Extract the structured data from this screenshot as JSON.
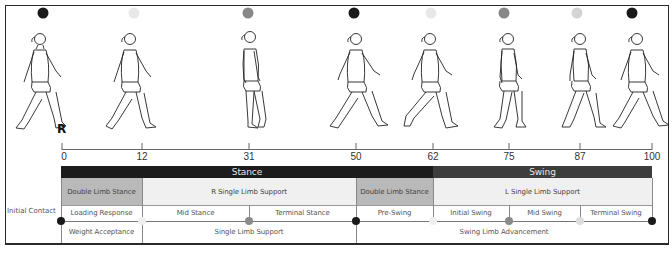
{
  "side_label": "Initial Contact",
  "limb_marker": "R",
  "phase_dot_colors": {
    "black": "#1a1a1a",
    "light": "#e6e6e6",
    "mid": "#888888",
    "pale": "#d4d4d4"
  },
  "top_dots": [
    {
      "x": 43,
      "color": "#1a1a1a"
    },
    {
      "x": 134,
      "color": "#e8e8e8"
    },
    {
      "x": 248,
      "color": "#888888"
    },
    {
      "x": 354,
      "color": "#1a1a1a"
    },
    {
      "x": 431,
      "color": "#e8e8e8"
    },
    {
      "x": 504,
      "color": "#888888"
    },
    {
      "x": 577,
      "color": "#d4d4d4"
    },
    {
      "x": 632,
      "color": "#1a1a1a"
    }
  ],
  "axis": {
    "ticks": [
      {
        "value": "0",
        "x": 62
      },
      {
        "value": "12",
        "x": 142
      },
      {
        "value": "31",
        "x": 249
      },
      {
        "value": "50",
        "x": 356
      },
      {
        "value": "62",
        "x": 433
      },
      {
        "value": "75",
        "x": 509
      },
      {
        "value": "87",
        "x": 580
      },
      {
        "value": "100",
        "x": 652
      }
    ]
  },
  "phases": {
    "stance": "Stance",
    "swing": "Swing"
  },
  "support_row": {
    "double_limb_stance_1": "Double Limb Stance",
    "r_single_limb_support": "R Single Limb Support",
    "double_limb_stance_2": "Double Limb Stance",
    "l_single_limb_support": "L Single Limb Support"
  },
  "subphase_row": {
    "loading_response": "Loading Response",
    "mid_stance": "Mid Stance",
    "terminal_stance": "Terminal Stance",
    "pre_swing": "Pre-Swing",
    "initial_swing": "Initial Swing",
    "mid_swing": "Mid Swing",
    "terminal_swing": "Terminal Swing"
  },
  "task_row": {
    "weight_acceptance": "Weight Acceptance",
    "single_limb_support": "Single Limb Support",
    "swing_limb_advancement": "Swing Limb Advancement"
  },
  "event_dots": [
    {
      "x": 61,
      "color": "#1a1a1a"
    },
    {
      "x": 142,
      "color": "#eeeeee"
    },
    {
      "x": 249,
      "color": "#8a8a8a"
    },
    {
      "x": 356,
      "color": "#1a1a1a"
    },
    {
      "x": 433,
      "color": "#eeeeee"
    },
    {
      "x": 509,
      "color": "#8a8a8a"
    },
    {
      "x": 580,
      "color": "#dddddd"
    },
    {
      "x": 652,
      "color": "#1a1a1a"
    }
  ],
  "figures": [
    {
      "x": 14,
      "pose": "heel-strike"
    },
    {
      "x": 104,
      "pose": "loading"
    },
    {
      "x": 222,
      "pose": "mid-stance"
    },
    {
      "x": 328,
      "pose": "terminal-stance"
    },
    {
      "x": 400,
      "pose": "pre-swing"
    },
    {
      "x": 478,
      "pose": "initial-swing"
    },
    {
      "x": 550,
      "pose": "mid-swing"
    },
    {
      "x": 607,
      "pose": "terminal-swing"
    }
  ]
}
